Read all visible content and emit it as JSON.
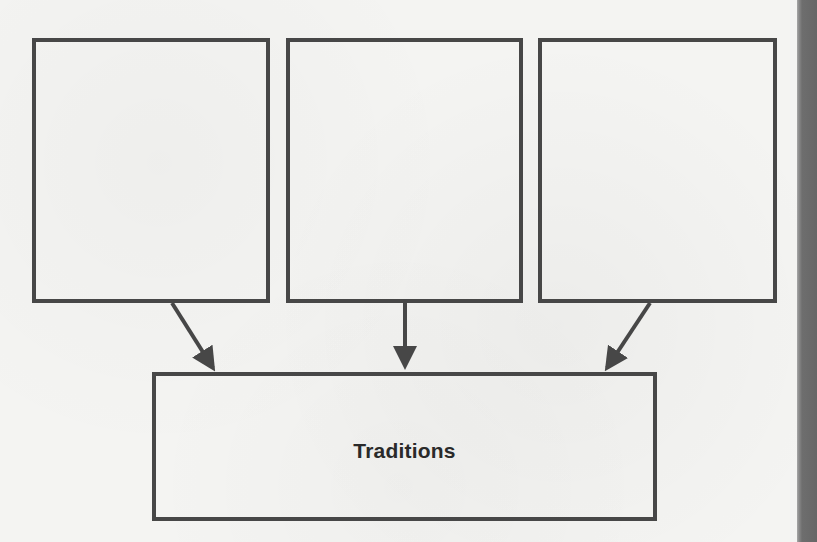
{
  "diagram": {
    "type": "graphic-organizer",
    "colors": {
      "border": "#474747",
      "text": "#2a2a2a",
      "background": "#f4f4f2",
      "edge_bar": "#666666"
    },
    "input_boxes": [
      {
        "id": "box-1",
        "label": ""
      },
      {
        "id": "box-2",
        "label": ""
      },
      {
        "id": "box-3",
        "label": ""
      }
    ],
    "output_box": {
      "id": "box-bottom",
      "label": "Traditions"
    },
    "arrows": [
      {
        "from": "box-1",
        "to": "box-bottom"
      },
      {
        "from": "box-2",
        "to": "box-bottom"
      },
      {
        "from": "box-3",
        "to": "box-bottom"
      }
    ]
  }
}
